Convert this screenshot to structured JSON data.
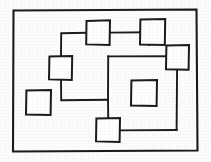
{
  "image": {
    "title": "Hand-drawn diagram of connected and isolated squares",
    "width": 211,
    "height": 162,
    "background_color": "#fdfdfd",
    "ink_color": "#1a1a1a",
    "style": "hand-drawn black ink line art on white paper"
  },
  "frame": {
    "label": "outer border rectangle",
    "x": 12,
    "y": 9,
    "width": 186,
    "height": 143,
    "stroke_width": 2.1,
    "path": "M13.5,10.5 L196.5,9.5 L197.5,150.5 L13.0,151.5 Z"
  },
  "shapes": [
    {
      "id": "square-top-center",
      "label": "top center square",
      "x": 86,
      "y": 20,
      "width": 24,
      "height": 25,
      "path": "M86.5,21.0 L110.0,20.2 L109.6,45.0 L86.2,44.4 Z"
    },
    {
      "id": "square-top-right",
      "label": "upper right square",
      "x": 140,
      "y": 19,
      "width": 25,
      "height": 26,
      "path": "M140.4,19.6 L165.2,19.0 L164.8,45.0 L140.0,44.6 Z"
    },
    {
      "id": "square-right",
      "label": "right side square",
      "x": 166,
      "y": 45,
      "width": 23,
      "height": 25,
      "path": "M166.4,45.6 L189.0,45.0 L188.6,69.8 L166.0,69.2 Z"
    },
    {
      "id": "square-left-middle",
      "label": "left middle square",
      "x": 49,
      "y": 56,
      "width": 23,
      "height": 24,
      "path": "M49.4,56.6 L72.2,56.0 L71.8,80.0 L49.0,79.4 Z"
    },
    {
      "id": "square-lower-left",
      "label": "isolated lower left square",
      "x": 26,
      "y": 90,
      "width": 25,
      "height": 25,
      "path": "M26.4,90.6 L51.0,90.0 L50.6,115.0 L26.0,114.4 Z"
    },
    {
      "id": "square-center-right",
      "label": "center right square",
      "x": 131,
      "y": 80,
      "width": 26,
      "height": 26,
      "path": "M131.4,80.6 L157.0,80.0 L156.6,106.0 L131.0,105.4 Z"
    },
    {
      "id": "square-bottom-center",
      "label": "bottom center square",
      "x": 96,
      "y": 118,
      "width": 24,
      "height": 24,
      "path": "M96.4,118.6 L120.0,118.0 L119.6,142.0 L96.0,141.4 Z"
    }
  ],
  "connectors": [
    {
      "id": "link-left-loop",
      "label": "left loop path from top center square down through left square to bottom center square",
      "path": "M86.2,32.8 L61.2,33.2 L61.0,56.4"
    },
    {
      "id": "link-left-lower",
      "label": "left square lower stem to horizontal run",
      "path": "M61.0,79.6 L61.2,100.2 L108.0,99.8"
    },
    {
      "id": "link-down-to-bottom-square",
      "label": "vertical drop into bottom center square",
      "path": "M108.0,99.8 L108.2,118.4"
    },
    {
      "id": "link-top-center-right",
      "label": "horizontal from top center square to upper right junction",
      "path": "M110.0,32.6 L149.0,32.2"
    },
    {
      "id": "link-top-right-down",
      "label": "vertical from top junction down to big rectangle top edge",
      "path": "M149.0,32.2 L149.2,45.0"
    },
    {
      "id": "link-right-square-stem",
      "label": "vertical stem under right square",
      "path": "M177.0,69.4 L177.2,56.2"
    },
    {
      "id": "big-rect-top",
      "label": "large rectangle top edge",
      "path": "M108.2,56.4 L177.2,56.2"
    },
    {
      "id": "big-rect-left",
      "label": "large rectangle left edge",
      "path": "M108.2,56.4 L108.0,99.8"
    },
    {
      "id": "big-rect-right",
      "label": "large rectangle right edge",
      "path": "M177.2,56.2 L176.6,130.0"
    },
    {
      "id": "big-rect-bottom",
      "label": "large rectangle bottom edge",
      "path": "M120.0,130.4 L176.6,130.0"
    }
  ],
  "counts": {
    "squares": 7,
    "frames": 1
  }
}
